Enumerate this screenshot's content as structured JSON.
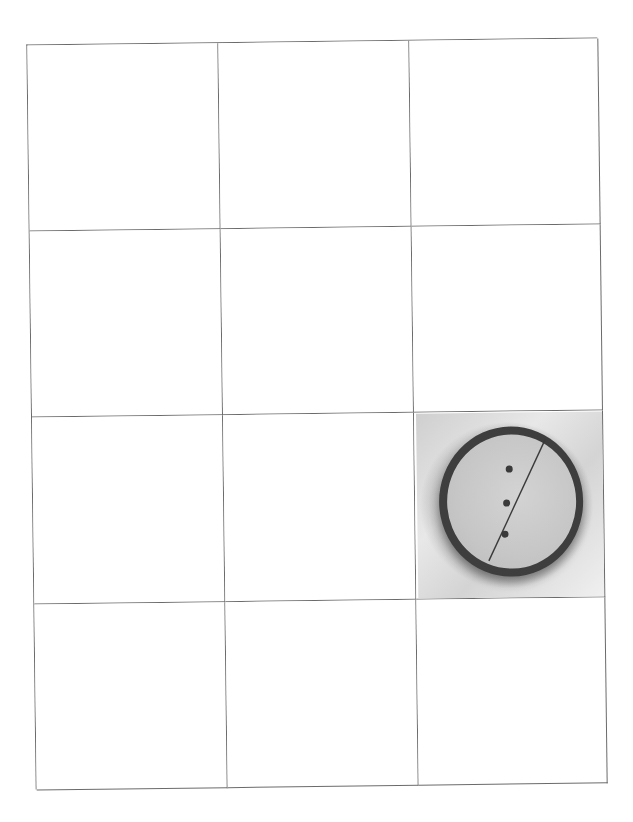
{
  "worksheet": {
    "grid": {
      "columns": 3,
      "rows": 4,
      "line_color": "#6b6b6b",
      "cells": [
        {
          "row": 1,
          "col": 1,
          "content": "empty"
        },
        {
          "row": 1,
          "col": 2,
          "content": "empty"
        },
        {
          "row": 1,
          "col": 3,
          "content": "empty"
        },
        {
          "row": 2,
          "col": 1,
          "content": "empty"
        },
        {
          "row": 2,
          "col": 2,
          "content": "empty"
        },
        {
          "row": 2,
          "col": 3,
          "content": "empty"
        },
        {
          "row": 3,
          "col": 1,
          "content": "empty"
        },
        {
          "row": 3,
          "col": 2,
          "content": "empty"
        },
        {
          "row": 3,
          "col": 3,
          "content": "photo"
        },
        {
          "row": 4,
          "col": 1,
          "content": "empty"
        },
        {
          "row": 4,
          "col": 2,
          "content": "empty"
        },
        {
          "row": 4,
          "col": 3,
          "content": "empty"
        }
      ]
    },
    "photo": {
      "subject": "petri-dish-with-line-and-three-dots",
      "dots": 3,
      "style": "grayscale"
    }
  }
}
